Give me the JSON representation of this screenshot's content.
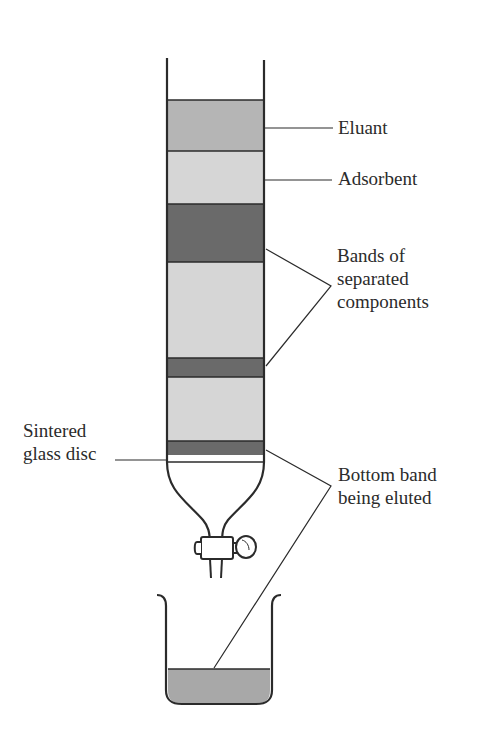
{
  "diagram": {
    "colors": {
      "outline": "#2b2b2b",
      "eluant": "#b5b5b5",
      "adsorbent": "#d6d6d6",
      "band_dark": "#6a6a6a",
      "collected_liquid": "#a8a8a8"
    },
    "labels": {
      "eluant": "Eluant",
      "adsorbent": "Adsorbent",
      "bands_line1": "Bands of",
      "bands_line2": "separated",
      "bands_line3": "components",
      "disc_line1": "Sintered",
      "disc_line2": "glass disc",
      "bottom_line1": "Bottom band",
      "bottom_line2": "being eluted"
    },
    "column_layers": [
      {
        "name": "eluant",
        "top": 100,
        "bottom": 151,
        "color": "#b5b5b5"
      },
      {
        "name": "adsorbent",
        "top": 151,
        "bottom": 204,
        "color": "#d6d6d6"
      },
      {
        "name": "band-1",
        "top": 204,
        "bottom": 262,
        "color": "#6a6a6a"
      },
      {
        "name": "adsorbent-gap-1",
        "top": 262,
        "bottom": 358,
        "color": "#d6d6d6"
      },
      {
        "name": "band-2",
        "top": 358,
        "bottom": 377,
        "color": "#6a6a6a"
      },
      {
        "name": "adsorbent-gap-2",
        "top": 377,
        "bottom": 441,
        "color": "#d6d6d6"
      },
      {
        "name": "band-3-bottom",
        "top": 441,
        "bottom": 455,
        "color": "#6a6a6a"
      }
    ]
  }
}
